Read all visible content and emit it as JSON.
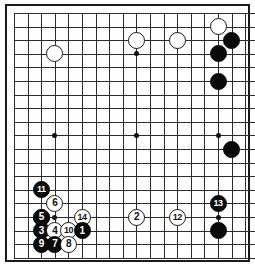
{
  "diagram": {
    "type": "go-board-diagram",
    "board_size": 19,
    "title": "",
    "colors": {
      "board_background": "#fdfdfb",
      "grid_line": "#2b2b2b",
      "border": "#1a1a1a",
      "black_stone": "#0a0a0a",
      "white_stone": "#ffffff",
      "black_label": "#ffffff",
      "white_label": "#111111"
    },
    "geometry": {
      "origin_x": 14,
      "origin_y": 13,
      "spacing": 13.6,
      "lines": 18,
      "frame_left": 5,
      "frame_top": 4,
      "frame_width": 245,
      "frame_height": 258
    },
    "star_points": [
      {
        "name": "star-top-left",
        "col": 3,
        "row": 3
      },
      {
        "name": "star-top-center",
        "col": 9,
        "row": 3
      },
      {
        "name": "star-top-right",
        "col": 15,
        "row": 3
      },
      {
        "name": "star-middle-left",
        "col": 3,
        "row": 9
      },
      {
        "name": "star-center",
        "col": 9,
        "row": 9
      },
      {
        "name": "star-middle-right",
        "col": 15,
        "row": 9
      },
      {
        "name": "star-bottom-left",
        "col": 3,
        "row": 15
      },
      {
        "name": "star-bottom-center",
        "col": 9,
        "row": 15
      },
      {
        "name": "star-bottom-right",
        "col": 15,
        "row": 15
      }
    ],
    "stones": [
      {
        "name": "white-stone-upper-right-corner",
        "color": "white",
        "col": 15,
        "row": 1,
        "label": ""
      },
      {
        "name": "black-stone-upper-right-edge",
        "color": "black",
        "col": 16,
        "row": 2,
        "label": ""
      },
      {
        "name": "black-stone-upper-right-a",
        "color": "black",
        "col": 15,
        "row": 3,
        "label": ""
      },
      {
        "name": "black-stone-upper-right-b",
        "color": "black",
        "col": 15,
        "row": 5,
        "label": ""
      },
      {
        "name": "white-stone-top-center-a",
        "color": "white",
        "col": 9,
        "row": 2,
        "label": ""
      },
      {
        "name": "white-stone-top-center-b",
        "color": "white",
        "col": 12,
        "row": 2,
        "label": ""
      },
      {
        "name": "white-stone-upper-left",
        "color": "white",
        "col": 3,
        "row": 3,
        "label": ""
      },
      {
        "name": "black-stone-right-side",
        "color": "black",
        "col": 16,
        "row": 10,
        "label": ""
      },
      {
        "name": "black-stone-lower-right",
        "color": "black",
        "col": 15,
        "row": 16,
        "label": ""
      },
      {
        "name": "white-stone-left-side-plain",
        "color": "white",
        "col": 2,
        "row": 15,
        "label": ""
      },
      {
        "name": "move-11",
        "color": "black",
        "col": 2,
        "row": 13,
        "label": "11"
      },
      {
        "name": "move-6",
        "color": "white",
        "col": 3,
        "row": 14,
        "label": "6"
      },
      {
        "name": "move-5",
        "color": "black",
        "col": 2,
        "row": 15,
        "label": "5"
      },
      {
        "name": "move-14",
        "color": "white",
        "col": 5,
        "row": 15,
        "label": "14"
      },
      {
        "name": "move-2",
        "color": "white",
        "col": 9,
        "row": 15,
        "label": "2"
      },
      {
        "name": "move-12",
        "color": "white",
        "col": 12,
        "row": 15,
        "label": "12"
      },
      {
        "name": "move-13",
        "color": "black",
        "col": 15,
        "row": 14,
        "label": "13"
      },
      {
        "name": "move-3",
        "color": "black",
        "col": 2,
        "row": 16,
        "label": "3"
      },
      {
        "name": "move-4",
        "color": "white",
        "col": 3,
        "row": 16,
        "label": "4"
      },
      {
        "name": "move-10",
        "color": "white",
        "col": 4,
        "row": 16,
        "label": "10"
      },
      {
        "name": "move-1",
        "color": "black",
        "col": 5,
        "row": 16,
        "label": "1"
      },
      {
        "name": "move-9",
        "color": "black",
        "col": 2,
        "row": 17,
        "label": "9"
      },
      {
        "name": "move-7",
        "color": "black",
        "col": 3,
        "row": 17,
        "label": "7"
      },
      {
        "name": "move-8",
        "color": "white",
        "col": 4,
        "row": 17,
        "label": "8"
      }
    ]
  }
}
